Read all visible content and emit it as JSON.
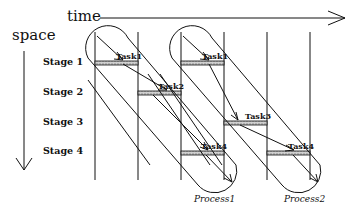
{
  "axes": {
    "time_label": "time",
    "space_label": "space"
  },
  "stages": [
    "Stage 1",
    "Stage 2",
    "Stage 3",
    "Stage 4"
  ],
  "processes": [
    {
      "label": "Process1",
      "tasks": [
        {
          "label": "Task1",
          "stage": 1
        },
        {
          "label": "Task2",
          "stage": 2
        },
        {
          "label": "Task4",
          "stage": 4
        }
      ]
    },
    {
      "label": "Process2",
      "tasks": [
        {
          "label": "Task1",
          "stage": 1
        },
        {
          "label": "Task3",
          "stage": 3
        },
        {
          "label": "Task4",
          "stage": 4
        }
      ]
    }
  ],
  "colors": {
    "line": "#111111",
    "bar": "#b8b8b8"
  }
}
